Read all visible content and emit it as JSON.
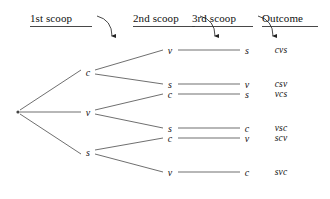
{
  "figure": {
    "type": "tree-diagram",
    "background_color": "#ffffff",
    "line_color": "#555555",
    "text_color": "#111111",
    "width": 330,
    "height": 199
  },
  "columns": [
    {
      "id": "col1",
      "label": "1st scoop",
      "x": 30,
      "y": 12,
      "underline_width": 62,
      "has_arrow": true,
      "arrow": {
        "start_x": 97,
        "start_y": 16,
        "ctrl_x": 112,
        "ctrl_y": 20,
        "end_x": 112,
        "end_y": 36
      }
    },
    {
      "id": "col2",
      "label": "2nd scoop",
      "x": 133,
      "y": 12,
      "underline_width": 62,
      "has_arrow": true,
      "arrow": {
        "start_x": 200,
        "start_y": 16,
        "ctrl_x": 215,
        "ctrl_y": 20,
        "end_x": 215,
        "end_y": 36
      }
    },
    {
      "id": "col3",
      "label": "3rd scoop",
      "x": 192,
      "y": 12,
      "underline_width": 61,
      "has_arrow": true,
      "arrow": {
        "start_x": 258,
        "start_y": 16,
        "ctrl_x": 273,
        "ctrl_y": 20,
        "end_x": 273,
        "end_y": 36
      }
    },
    {
      "id": "col4",
      "label": "Outcome",
      "x": 262,
      "y": 12,
      "underline_width": 56,
      "has_arrow": false,
      "arrow": null
    }
  ],
  "root": {
    "id": "root",
    "x": 13,
    "y": 112
  },
  "level1": [
    {
      "id": "n-c",
      "label": "c",
      "x": 88,
      "y": 72
    },
    {
      "id": "n-v",
      "label": "v",
      "x": 88,
      "y": 112
    },
    {
      "id": "n-s",
      "label": "s",
      "x": 88,
      "y": 152
    }
  ],
  "level2": [
    {
      "id": "n-cv",
      "label": "v",
      "x": 170,
      "y": 50,
      "parent": "n-c"
    },
    {
      "id": "n-cs",
      "label": "s",
      "x": 170,
      "y": 84,
      "parent": "n-c"
    },
    {
      "id": "n-vc",
      "label": "c",
      "x": 170,
      "y": 94,
      "parent": "n-v"
    },
    {
      "id": "n-vs",
      "label": "s",
      "x": 170,
      "y": 128,
      "parent": "n-v"
    },
    {
      "id": "n-sc",
      "label": "c",
      "x": 170,
      "y": 138,
      "parent": "n-s"
    },
    {
      "id": "n-sv",
      "label": "v",
      "x": 170,
      "y": 172,
      "parent": "n-s"
    }
  ],
  "level3": [
    {
      "id": "n-cvs",
      "label": "s",
      "x": 247,
      "y": 50,
      "parent": "n-cv"
    },
    {
      "id": "n-csv",
      "label": "v",
      "x": 247,
      "y": 84,
      "parent": "n-cs"
    },
    {
      "id": "n-vcs",
      "label": "s",
      "x": 247,
      "y": 94,
      "parent": "n-vc"
    },
    {
      "id": "n-vsc",
      "label": "c",
      "x": 247,
      "y": 128,
      "parent": "n-vs"
    },
    {
      "id": "n-scv",
      "label": "v",
      "x": 247,
      "y": 138,
      "parent": "n-sc"
    },
    {
      "id": "n-svc",
      "label": "c",
      "x": 247,
      "y": 172,
      "parent": "n-sv"
    }
  ],
  "outcomes": [
    {
      "id": "out-cvs",
      "label": "cvs",
      "x": 281,
      "y": 50
    },
    {
      "id": "out-csv",
      "label": "csv",
      "x": 281,
      "y": 84
    },
    {
      "id": "out-vcs",
      "label": "vcs",
      "x": 281,
      "y": 94
    },
    {
      "id": "out-vsc",
      "label": "vsc",
      "x": 281,
      "y": 128
    },
    {
      "id": "out-scv",
      "label": "scv",
      "x": 281,
      "y": 138
    },
    {
      "id": "out-svc",
      "label": "svc",
      "x": 281,
      "y": 172
    }
  ],
  "edges_level1": [
    {
      "from": [
        20,
        110
      ],
      "to": [
        81,
        70
      ]
    },
    {
      "from": [
        20,
        112
      ],
      "to": [
        81,
        112
      ]
    },
    {
      "from": [
        20,
        114
      ],
      "to": [
        81,
        154
      ]
    }
  ],
  "edges_level2": [
    {
      "from": [
        95,
        70
      ],
      "to": [
        163,
        50
      ]
    },
    {
      "from": [
        95,
        74
      ],
      "to": [
        163,
        84
      ]
    },
    {
      "from": [
        95,
        110
      ],
      "to": [
        163,
        94
      ]
    },
    {
      "from": [
        95,
        114
      ],
      "to": [
        163,
        128
      ]
    },
    {
      "from": [
        95,
        150
      ],
      "to": [
        163,
        138
      ]
    },
    {
      "from": [
        95,
        154
      ],
      "to": [
        163,
        172
      ]
    }
  ],
  "edges_level3": [
    {
      "from": [
        178,
        50
      ],
      "to": [
        240,
        50
      ]
    },
    {
      "from": [
        178,
        84
      ],
      "to": [
        240,
        84
      ]
    },
    {
      "from": [
        178,
        94
      ],
      "to": [
        240,
        94
      ]
    },
    {
      "from": [
        178,
        128
      ],
      "to": [
        240,
        128
      ]
    },
    {
      "from": [
        178,
        138
      ],
      "to": [
        240,
        138
      ]
    },
    {
      "from": [
        178,
        172
      ],
      "to": [
        240,
        172
      ]
    }
  ]
}
